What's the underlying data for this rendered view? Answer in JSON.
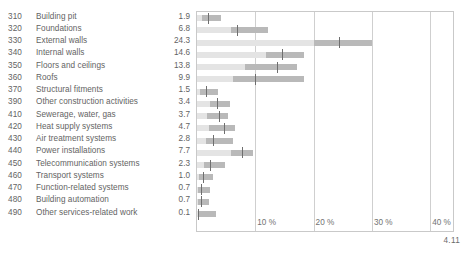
{
  "caption": "4.11",
  "chart_data": {
    "type": "bar",
    "title": "",
    "xlabel": "",
    "ylabel": "",
    "xlim": [
      0,
      44
    ],
    "grid": true,
    "legend": null,
    "axis_ticks": [
      {
        "value": 10,
        "label": "10 %"
      },
      {
        "value": 20,
        "label": "20 %"
      },
      {
        "value": 30,
        "label": "30 %"
      },
      {
        "value": 40,
        "label": "40 %"
      }
    ],
    "columns": [
      "Code",
      "Cost group",
      "Share (%)"
    ],
    "categories": [
      "Building pit",
      "Foundations",
      "External walls",
      "Internal walls",
      "Floors and ceilings",
      "Roofs",
      "Structural fitments",
      "Other construction activities",
      "Sewerage, water, gas",
      "Heat supply systems",
      "Air treatment systems",
      "Power installations",
      "Telecommunication systems",
      "Transport systems",
      "Function-related systems",
      "Building automation",
      "Other services-related work"
    ],
    "values": [
      1.9,
      6.8,
      24.3,
      14.6,
      13.8,
      9.9,
      1.5,
      3.4,
      3.7,
      4.7,
      2.8,
      7.7,
      2.3,
      1.0,
      0.7,
      0.7,
      0.1
    ],
    "rows": [
      {
        "code": "310",
        "label": "Building pit",
        "value": "1.9",
        "range_start": 0.0,
        "range_end": 4.2,
        "box_start": 0.9,
        "box_end": 4.2,
        "median": 1.9
      },
      {
        "code": "320",
        "label": "Foundations",
        "value": "6.8",
        "range_start": 0.0,
        "range_end": 12.2,
        "box_start": 5.9,
        "box_end": 12.2,
        "median": 6.8
      },
      {
        "code": "330",
        "label": "External walls",
        "value": "24.3",
        "range_start": 0.0,
        "range_end": 30.0,
        "box_start": 20.0,
        "box_end": 30.0,
        "median": 24.3
      },
      {
        "code": "340",
        "label": "Internal walls",
        "value": "14.6",
        "range_start": 0.0,
        "range_end": 18.3,
        "box_start": 11.8,
        "box_end": 18.3,
        "median": 14.6
      },
      {
        "code": "350",
        "label": "Floors and ceilings",
        "value": "13.8",
        "range_start": 0.0,
        "range_end": 17.2,
        "box_start": 8.2,
        "box_end": 17.2,
        "median": 13.8
      },
      {
        "code": "360",
        "label": "Roofs",
        "value": "9.9",
        "range_start": 0.0,
        "range_end": 18.3,
        "box_start": 6.2,
        "box_end": 18.3,
        "median": 9.9
      },
      {
        "code": "370",
        "label": "Structural fitments",
        "value": "1.5",
        "range_start": 0.0,
        "range_end": 3.6,
        "box_start": 0.6,
        "box_end": 3.6,
        "median": 1.5
      },
      {
        "code": "390",
        "label": "Other construction activities",
        "value": "3.4",
        "range_start": 0.0,
        "range_end": 5.6,
        "box_start": 2.2,
        "box_end": 5.6,
        "median": 3.4
      },
      {
        "code": "410",
        "label": "Sewerage, water, gas",
        "value": "3.7",
        "range_start": 0.0,
        "range_end": 5.3,
        "box_start": 1.7,
        "box_end": 5.3,
        "median": 3.7
      },
      {
        "code": "420",
        "label": "Heat supply systems",
        "value": "4.7",
        "range_start": 0.0,
        "range_end": 6.6,
        "box_start": 2.1,
        "box_end": 6.6,
        "median": 4.7
      },
      {
        "code": "430",
        "label": "Air treatment systems",
        "value": "2.8",
        "range_start": 0.0,
        "range_end": 6.2,
        "box_start": 1.5,
        "box_end": 6.2,
        "median": 2.8
      },
      {
        "code": "440",
        "label": "Power installations",
        "value": "7.7",
        "range_start": 0.0,
        "range_end": 9.6,
        "box_start": 5.8,
        "box_end": 9.6,
        "median": 7.7
      },
      {
        "code": "450",
        "label": "Telecommunication systems",
        "value": "2.3",
        "range_start": 0.0,
        "range_end": 4.8,
        "box_start": 1.2,
        "box_end": 4.8,
        "median": 2.3
      },
      {
        "code": "460",
        "label": "Transport systems",
        "value": "1.0",
        "range_start": 0.0,
        "range_end": 2.8,
        "box_start": 0.4,
        "box_end": 2.8,
        "median": 1.0
      },
      {
        "code": "470",
        "label": "Function-related systems",
        "value": "0.7",
        "range_start": 0.0,
        "range_end": 2.2,
        "box_start": 0.2,
        "box_end": 2.2,
        "median": 0.7
      },
      {
        "code": "480",
        "label": "Building automation",
        "value": "0.7",
        "range_start": 0.0,
        "range_end": 2.1,
        "box_start": 0.2,
        "box_end": 2.1,
        "median": 0.7
      },
      {
        "code": "490",
        "label": "Other services-related work",
        "value": "0.1",
        "range_start": 0.0,
        "range_end": 3.3,
        "box_start": 0.4,
        "box_end": 3.3,
        "median": 0.2
      }
    ],
    "colors": {
      "range_bar": "#e4e4e4",
      "box_bar": "#b9b9b9",
      "median_tick": "#6e6e6e",
      "gridline": "#cfcfcf",
      "frame": "#c9c9c9",
      "text": "#636363"
    }
  }
}
